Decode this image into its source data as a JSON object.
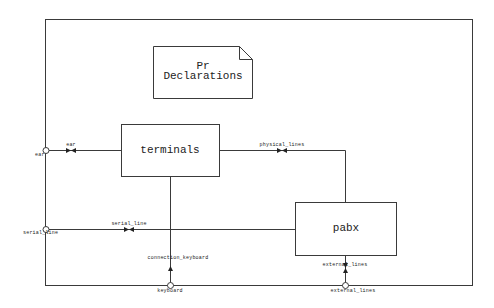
{
  "diagram": {
    "type": "SDL block diagram",
    "colors": {
      "line": "#3a3a3a",
      "background": "#ffffff",
      "text": "#222222"
    },
    "text_symbol": {
      "line1": "Pr",
      "line2": "Declarations"
    },
    "blocks": [
      {
        "id": "terminals",
        "label": "terminals"
      },
      {
        "id": "pabx",
        "label": "pabx"
      }
    ],
    "gates": [
      {
        "id": "ear",
        "label": "ear"
      },
      {
        "id": "serial_line",
        "label": "serial_line"
      },
      {
        "id": "keyboard",
        "label": "keyboard"
      },
      {
        "id": "external_lines",
        "label": "external_lines"
      }
    ],
    "channels": [
      {
        "id": "ch-ear",
        "label": "ear",
        "from": "terminals",
        "to": "ear"
      },
      {
        "id": "ch-physical",
        "label": "physical_lines",
        "from": "terminals",
        "to": "pabx"
      },
      {
        "id": "ch-serial",
        "label": "serial_line",
        "from": "pabx",
        "to": "serial_line"
      },
      {
        "id": "ch-keyboard",
        "label": "connection_keyboard",
        "from": "keyboard",
        "to": "terminals"
      },
      {
        "id": "ch-external",
        "label": "external_lines",
        "from": "external_lines",
        "to": "pabx"
      }
    ]
  }
}
